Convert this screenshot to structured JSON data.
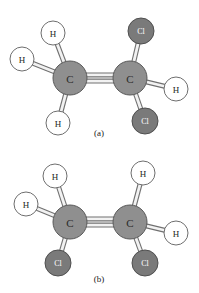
{
  "figure": {
    "background_color": "#ffffff",
    "width": 199,
    "height": 293
  },
  "palette": {
    "carbon_fill": "#8f8f8f",
    "carbon_stroke": "#5a5a5a",
    "carbon_text": "#2b2b2b",
    "chlorine_fill": "#7a7a7a",
    "chlorine_stroke": "#4f4f4f",
    "chlorine_text": "#ffffff",
    "hydrogen_fill": "#ffffff",
    "hydrogen_stroke": "#6e6e6e",
    "hydrogen_text": "#1f1f1f",
    "bond_fill": "#f2f2f2",
    "bond_stroke": "#707070",
    "caption_text": "#1a1a1a"
  },
  "panels": [
    {
      "id": "panel-a",
      "caption": "(a)",
      "caption_x": 99,
      "caption_y": 133,
      "atoms": [
        {
          "id": "a-c-left",
          "element": "C",
          "label": "C",
          "x": 70,
          "y": 78,
          "r": 17,
          "kind": "carbon"
        },
        {
          "id": "a-c-right",
          "element": "C",
          "label": "C",
          "x": 130,
          "y": 78,
          "r": 17,
          "kind": "carbon"
        },
        {
          "id": "a-h-topleft",
          "element": "H",
          "label": "H",
          "x": 53,
          "y": 33,
          "r": 12,
          "kind": "hydrogen"
        },
        {
          "id": "a-h-left",
          "element": "H",
          "label": "H",
          "x": 22,
          "y": 59,
          "r": 12,
          "kind": "hydrogen"
        },
        {
          "id": "a-h-bottomleft",
          "element": "H",
          "label": "H",
          "x": 58,
          "y": 123,
          "r": 12,
          "kind": "hydrogen"
        },
        {
          "id": "a-cl-top",
          "element": "Cl",
          "label": "Cl",
          "x": 141,
          "y": 31,
          "r": 13,
          "kind": "chlorine"
        },
        {
          "id": "a-h-right",
          "element": "H",
          "label": "H",
          "x": 176,
          "y": 89,
          "r": 12,
          "kind": "hydrogen"
        },
        {
          "id": "a-cl-bottom",
          "element": "Cl",
          "label": "Cl",
          "x": 145,
          "y": 121,
          "r": 13,
          "kind": "chlorine"
        }
      ],
      "bonds": [
        {
          "id": "a-bond-cc",
          "from": "a-c-left",
          "to": "a-c-right",
          "order": 2,
          "width": 5
        },
        {
          "id": "a-bond-c-h-tl",
          "from": "a-c-left",
          "to": "a-h-topleft",
          "order": 1,
          "width": 5
        },
        {
          "id": "a-bond-c-h-l",
          "from": "a-c-left",
          "to": "a-h-left",
          "order": 1,
          "width": 5
        },
        {
          "id": "a-bond-c-h-bl",
          "from": "a-c-left",
          "to": "a-h-bottomleft",
          "order": 1,
          "width": 5
        },
        {
          "id": "a-bond-c-cl-t",
          "from": "a-c-right",
          "to": "a-cl-top",
          "order": 1,
          "width": 5
        },
        {
          "id": "a-bond-c-h-r",
          "from": "a-c-right",
          "to": "a-h-right",
          "order": 1,
          "width": 5
        },
        {
          "id": "a-bond-c-cl-b",
          "from": "a-c-right",
          "to": "a-cl-bottom",
          "order": 1,
          "width": 5
        }
      ]
    },
    {
      "id": "panel-b",
      "caption": "(b)",
      "caption_x": 99,
      "caption_y": 279,
      "atoms": [
        {
          "id": "b-c-left",
          "element": "C",
          "label": "C",
          "x": 70,
          "y": 222,
          "r": 17,
          "kind": "carbon"
        },
        {
          "id": "b-c-right",
          "element": "C",
          "label": "C",
          "x": 130,
          "y": 222,
          "r": 17,
          "kind": "carbon"
        },
        {
          "id": "b-h-topleft",
          "element": "H",
          "label": "H",
          "x": 55,
          "y": 176,
          "r": 12,
          "kind": "hydrogen"
        },
        {
          "id": "b-h-left",
          "element": "H",
          "label": "H",
          "x": 26,
          "y": 204,
          "r": 12,
          "kind": "hydrogen"
        },
        {
          "id": "b-cl-bottomleft",
          "element": "Cl",
          "label": "Cl",
          "x": 58,
          "y": 263,
          "r": 13,
          "kind": "chlorine"
        },
        {
          "id": "b-h-topright",
          "element": "H",
          "label": "H",
          "x": 143,
          "y": 173,
          "r": 12,
          "kind": "hydrogen"
        },
        {
          "id": "b-h-right",
          "element": "H",
          "label": "H",
          "x": 176,
          "y": 233,
          "r": 12,
          "kind": "hydrogen"
        },
        {
          "id": "b-cl-bottomright",
          "element": "Cl",
          "label": "Cl",
          "x": 145,
          "y": 263,
          "r": 13,
          "kind": "chlorine"
        }
      ],
      "bonds": [
        {
          "id": "b-bond-cc",
          "from": "b-c-left",
          "to": "b-c-right",
          "order": 2,
          "width": 5
        },
        {
          "id": "b-bond-c-h-tl",
          "from": "b-c-left",
          "to": "b-h-topleft",
          "order": 1,
          "width": 5
        },
        {
          "id": "b-bond-c-h-l",
          "from": "b-c-left",
          "to": "b-h-left",
          "order": 1,
          "width": 5
        },
        {
          "id": "b-bond-c-cl-bl",
          "from": "b-c-left",
          "to": "b-cl-bottomleft",
          "order": 1,
          "width": 5
        },
        {
          "id": "b-bond-c-h-tr",
          "from": "b-c-right",
          "to": "b-h-topright",
          "order": 1,
          "width": 5
        },
        {
          "id": "b-bond-c-h-r",
          "from": "b-c-right",
          "to": "b-h-right",
          "order": 1,
          "width": 5
        },
        {
          "id": "b-bond-c-cl-br",
          "from": "b-c-right",
          "to": "b-cl-bottomright",
          "order": 1,
          "width": 5
        }
      ]
    }
  ],
  "typography": {
    "carbon_font_size": 11,
    "chlorine_font_size": 8,
    "hydrogen_font_size": 9,
    "caption_font_size": 9
  }
}
